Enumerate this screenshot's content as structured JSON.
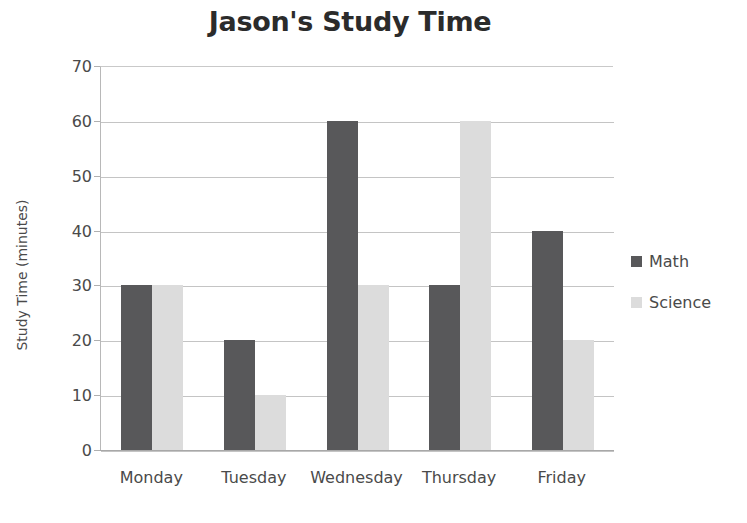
{
  "chart_data": {
    "type": "bar",
    "title": "Jason's Study Time",
    "xlabel": "",
    "ylabel": "Study Time (minutes)",
    "categories": [
      "Monday",
      "Tuesday",
      "Wednesday",
      "Thursday",
      "Friday"
    ],
    "series": [
      {
        "name": "Math",
        "color": "#58585a",
        "values": [
          30,
          20,
          60,
          30,
          40
        ]
      },
      {
        "name": "Science",
        "color": "#dcdcdc",
        "values": [
          30,
          10,
          30,
          60,
          20
        ]
      }
    ],
    "ylim": [
      0,
      70
    ],
    "ytick_step": 10,
    "yticks": [
      0,
      10,
      20,
      30,
      40,
      50,
      60,
      70
    ],
    "ytick_labels": [
      "0",
      "10",
      "20",
      "30",
      "40",
      "50",
      "60",
      "70"
    ],
    "grid": true,
    "legend_position": "right"
  }
}
